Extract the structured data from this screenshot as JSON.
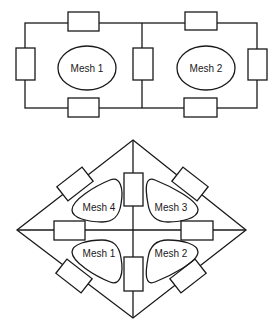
{
  "diagram": {
    "top_circuit": {
      "description": "Two-mesh planar circuit with 7 resistors",
      "meshes": [
        {
          "label": "Mesh 1"
        },
        {
          "label": "Mesh 2"
        }
      ],
      "resistor_count": 7
    },
    "bottom_circuit": {
      "description": "Diamond-shaped four-mesh circuit with 8 resistors",
      "meshes": [
        {
          "label": "Mesh 1"
        },
        {
          "label": "Mesh 2"
        },
        {
          "label": "Mesh 3"
        },
        {
          "label": "Mesh 4"
        }
      ],
      "resistor_count": 8
    },
    "colors": {
      "line": "#1a1a1a",
      "background": "#ffffff"
    }
  }
}
